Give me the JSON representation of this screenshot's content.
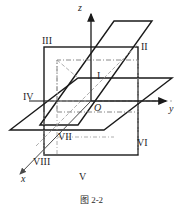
{
  "figure": {
    "caption": "图 2-2",
    "origin_label": "O",
    "axes": [
      {
        "id": "x",
        "label": "x",
        "direction": "down-left",
        "x": 22,
        "y": 176
      },
      {
        "id": "y",
        "label": "y",
        "direction": "right",
        "x": 170,
        "y": 106
      },
      {
        "id": "z",
        "label": "z",
        "direction": "up",
        "x": 80,
        "y": 6
      }
    ],
    "octants": [
      {
        "id": "I",
        "label": "I",
        "x": 97,
        "y": 72
      },
      {
        "id": "II",
        "label": "II",
        "x": 141,
        "y": 43
      },
      {
        "id": "III",
        "label": "III",
        "x": 43,
        "y": 38
      },
      {
        "id": "IV",
        "label": "IV",
        "x": 24,
        "y": 93
      },
      {
        "id": "V",
        "label": "V",
        "x": 79,
        "y": 173
      },
      {
        "id": "VI",
        "label": "VI",
        "x": 137,
        "y": 139
      },
      {
        "id": "VII",
        "label": "VII",
        "x": 59,
        "y": 133
      },
      {
        "id": "VIII",
        "label": "VIII",
        "x": 34,
        "y": 158
      }
    ],
    "colors": {
      "stroke": "#1a1a1a",
      "dashed": "#6f6f6f",
      "background": "#ffffff"
    },
    "geometry": {
      "origin": {
        "x": 91,
        "y": 101
      },
      "yoz_plane": "rectangle x from 44 to 138, y from 47 to 155",
      "xoy_plane": "parallelogram (10,130)-(104,130)-(172,78)-(78,78)",
      "xoz_plane": "parallelogram (40,125)-(114,21)-(152,21)-(78,125)"
    }
  }
}
